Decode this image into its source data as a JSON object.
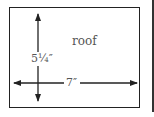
{
  "diagram": {
    "label_roof": "roof",
    "label_height": "5¼″",
    "label_width": "7″",
    "stroke_color": "#222222",
    "text_color": "#555555"
  }
}
